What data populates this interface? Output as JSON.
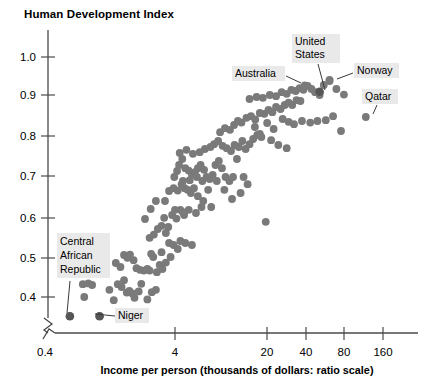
{
  "chart_data": {
    "type": "scatter",
    "title": "Human Development Index",
    "ylabel": "Human Development Index",
    "xlabel": "Income per person (thousands of dollars: ratio scale)",
    "xscale": "log",
    "xlim": [
      0.4,
      260
    ],
    "ylim": [
      0.33,
      1.04
    ],
    "grid": false,
    "legend": null,
    "x_ticks": [
      "0.4",
      "4",
      "20",
      "40",
      "80",
      "160"
    ],
    "x_tick_values": [
      0.4,
      4,
      20,
      40,
      80,
      160
    ],
    "y_ticks": [
      "0.4",
      "0.5",
      "0.6",
      "0.7",
      "0.8",
      "0.9",
      "1.0"
    ],
    "y_tick_values": [
      0.4,
      0.5,
      0.6,
      0.7,
      0.8,
      0.9,
      1.0
    ],
    "axis_break": true,
    "marker_color": "#7a7a7a",
    "highlight_color": "#565656",
    "points": [
      [
        0.62,
        0.352
      ],
      [
        1.05,
        0.352
      ],
      [
        0.78,
        0.432
      ],
      [
        0.86,
        0.434
      ],
      [
        0.92,
        0.43
      ],
      [
        0.8,
        0.4
      ],
      [
        1.25,
        0.418
      ],
      [
        1.35,
        0.392
      ],
      [
        1.55,
        0.425
      ],
      [
        1.62,
        0.442
      ],
      [
        1.7,
        0.411
      ],
      [
        1.78,
        0.415
      ],
      [
        1.88,
        0.409
      ],
      [
        1.95,
        0.398
      ],
      [
        2.1,
        0.414
      ],
      [
        2.45,
        0.394
      ],
      [
        1.4,
        0.485
      ],
      [
        1.52,
        0.475
      ],
      [
        1.62,
        0.505
      ],
      [
        1.72,
        0.498
      ],
      [
        1.8,
        0.506
      ],
      [
        1.92,
        0.492
      ],
      [
        2.02,
        0.472
      ],
      [
        2.15,
        0.468
      ],
      [
        2.3,
        0.466
      ],
      [
        2.45,
        0.47
      ],
      [
        2.55,
        0.466
      ],
      [
        2.62,
        0.508
      ],
      [
        2.72,
        0.5
      ],
      [
        2.9,
        0.462
      ],
      [
        3.05,
        0.48
      ],
      [
        3.2,
        0.47
      ],
      [
        2.55,
        0.548
      ],
      [
        2.75,
        0.556
      ],
      [
        2.95,
        0.57
      ],
      [
        3.15,
        0.578
      ],
      [
        2.35,
        0.595
      ],
      [
        2.6,
        0.62
      ],
      [
        2.85,
        0.64
      ],
      [
        3.4,
        0.56
      ],
      [
        3.6,
        0.535
      ],
      [
        3.9,
        0.53
      ],
      [
        4.2,
        0.52
      ],
      [
        4.4,
        0.54
      ],
      [
        4.8,
        0.535
      ],
      [
        5.4,
        0.53
      ],
      [
        3.3,
        0.598
      ],
      [
        3.55,
        0.575
      ],
      [
        3.8,
        0.605
      ],
      [
        4.1,
        0.596
      ],
      [
        4.4,
        0.618
      ],
      [
        4.7,
        0.605
      ],
      [
        3.35,
        0.64
      ],
      [
        3.6,
        0.665
      ],
      [
        3.9,
        0.672
      ],
      [
        4.2,
        0.666
      ],
      [
        4.5,
        0.682
      ],
      [
        4.75,
        0.672
      ],
      [
        5.0,
        0.668
      ],
      [
        5.3,
        0.66
      ],
      [
        5.6,
        0.672
      ],
      [
        6.0,
        0.652
      ],
      [
        6.4,
        0.625
      ],
      [
        3.95,
        0.7
      ],
      [
        4.15,
        0.715
      ],
      [
        4.3,
        0.73
      ],
      [
        4.55,
        0.745
      ],
      [
        4.8,
        0.722
      ],
      [
        5.1,
        0.716
      ],
      [
        5.4,
        0.706
      ],
      [
        5.7,
        0.712
      ],
      [
        6.0,
        0.722
      ],
      [
        6.3,
        0.73
      ],
      [
        6.7,
        0.718
      ],
      [
        7.0,
        0.7
      ],
      [
        7.4,
        0.695
      ],
      [
        7.8,
        0.705
      ],
      [
        8.2,
        0.73
      ],
      [
        8.7,
        0.74
      ],
      [
        9.2,
        0.722
      ],
      [
        9.8,
        0.7
      ],
      [
        10.5,
        0.69
      ],
      [
        11.2,
        0.7
      ],
      [
        12.0,
        0.745
      ],
      [
        4.35,
        0.76
      ],
      [
        4.9,
        0.768
      ],
      [
        5.5,
        0.758
      ],
      [
        6.2,
        0.762
      ],
      [
        6.8,
        0.77
      ],
      [
        7.5,
        0.775
      ],
      [
        8.0,
        0.782
      ],
      [
        8.6,
        0.79
      ],
      [
        9.3,
        0.778
      ],
      [
        10.0,
        0.772
      ],
      [
        10.8,
        0.765
      ],
      [
        11.5,
        0.78
      ],
      [
        12.4,
        0.775
      ],
      [
        13.2,
        0.79
      ],
      [
        14.0,
        0.77
      ],
      [
        15.0,
        0.782
      ],
      [
        16.0,
        0.795
      ],
      [
        17.2,
        0.805
      ],
      [
        18.5,
        0.8
      ],
      [
        20.0,
        0.588
      ],
      [
        8.9,
        0.812
      ],
      [
        9.7,
        0.822
      ],
      [
        10.6,
        0.818
      ],
      [
        11.4,
        0.83
      ],
      [
        12.2,
        0.84
      ],
      [
        13.0,
        0.836
      ],
      [
        14.2,
        0.848
      ],
      [
        15.4,
        0.852
      ],
      [
        16.6,
        0.844
      ],
      [
        18.0,
        0.86
      ],
      [
        19.5,
        0.858
      ],
      [
        21.0,
        0.868
      ],
      [
        22.5,
        0.862
      ],
      [
        24.0,
        0.875
      ],
      [
        26.0,
        0.87
      ],
      [
        28.0,
        0.88
      ],
      [
        30.0,
        0.886
      ],
      [
        32.0,
        0.88
      ],
      [
        34.5,
        0.892
      ],
      [
        37.0,
        0.89
      ],
      [
        15.0,
        0.895
      ],
      [
        17.0,
        0.9
      ],
      [
        19.0,
        0.898
      ],
      [
        21.5,
        0.905
      ],
      [
        24.0,
        0.902
      ],
      [
        26.5,
        0.912
      ],
      [
        29.0,
        0.908
      ],
      [
        31.5,
        0.918
      ],
      [
        34.0,
        0.915
      ],
      [
        36.5,
        0.922
      ],
      [
        39.0,
        0.918
      ],
      [
        42.0,
        0.928
      ],
      [
        45.0,
        0.92
      ],
      [
        48.0,
        0.912
      ],
      [
        52.0,
        0.905
      ],
      [
        56.0,
        0.93
      ],
      [
        62.0,
        0.94
      ],
      [
        70.0,
        0.92
      ],
      [
        80.0,
        0.906
      ],
      [
        27.0,
        0.845
      ],
      [
        30.0,
        0.838
      ],
      [
        33.0,
        0.832
      ],
      [
        38.0,
        0.84
      ],
      [
        44.0,
        0.836
      ],
      [
        50.0,
        0.84
      ],
      [
        58.0,
        0.842
      ],
      [
        66.0,
        0.852
      ],
      [
        76.0,
        0.815
      ],
      [
        22.0,
        0.792
      ],
      [
        25.0,
        0.78
      ],
      [
        29.0,
        0.772
      ],
      [
        23.0,
        0.82
      ],
      [
        20.5,
        0.835
      ],
      [
        18.0,
        0.808
      ],
      [
        16.5,
        0.825
      ],
      [
        13.5,
        0.7
      ],
      [
        14.5,
        0.682
      ],
      [
        12.8,
        0.66
      ],
      [
        11.0,
        0.645
      ],
      [
        9.6,
        0.668
      ],
      [
        8.4,
        0.69
      ],
      [
        7.2,
        0.668
      ],
      [
        6.5,
        0.69
      ],
      [
        5.9,
        0.7
      ],
      [
        5.2,
        0.692
      ],
      [
        4.6,
        0.69
      ],
      [
        6.6,
        0.64
      ],
      [
        7.6,
        0.625
      ],
      [
        5.8,
        0.61
      ],
      [
        5.1,
        0.618
      ],
      [
        4.6,
        0.612
      ],
      [
        4.0,
        0.618
      ],
      [
        3.7,
        0.5
      ],
      [
        3.4,
        0.486
      ],
      [
        3.15,
        0.512
      ],
      [
        2.2,
        0.433
      ],
      [
        2.65,
        0.412
      ],
      [
        2.85,
        0.418
      ],
      [
        1.45,
        0.432
      ]
    ],
    "highlight_points": [
      {
        "label": "United States",
        "x": 52.0,
        "y": 0.913
      },
      {
        "label": "Central African Republic",
        "x": 0.62,
        "y": 0.352
      },
      {
        "label": "Niger",
        "x": 1.05,
        "y": 0.352
      }
    ],
    "annotations": [
      {
        "label": "Australia",
        "x": 40.0,
        "y": 0.929
      },
      {
        "label": "United States",
        "x": 52.0,
        "y": 0.913
      },
      {
        "label": "Norway",
        "x": 62.0,
        "y": 0.943
      },
      {
        "label": "Qatar",
        "x": 118.0,
        "y": 0.85
      },
      {
        "label": "Central African Republic",
        "x": 0.62,
        "y": 0.352
      },
      {
        "label": "Niger",
        "x": 1.05,
        "y": 0.352
      }
    ]
  },
  "labels": {
    "title": "Human Development Index",
    "xaxis_title": "Income per person (thousands of dollars: ratio scale)",
    "callout_australia": "Australia",
    "callout_united_states_line1": "United",
    "callout_united_states_line2": "States",
    "callout_norway": "Norway",
    "callout_qatar": "Qatar",
    "callout_car_line1": "Central",
    "callout_car_line2": "African",
    "callout_car_line3": "Republic",
    "callout_niger": "Niger",
    "y_tick_10": "1.0",
    "y_tick_09": "0.9",
    "y_tick_08": "0.8",
    "y_tick_07": "0.7",
    "y_tick_06": "0.6",
    "y_tick_05": "0.5",
    "y_tick_04": "0.4",
    "x_tick_04": "0.4",
    "x_tick_4": "4",
    "x_tick_20": "20",
    "x_tick_40": "40",
    "x_tick_80": "80",
    "x_tick_160": "160"
  }
}
